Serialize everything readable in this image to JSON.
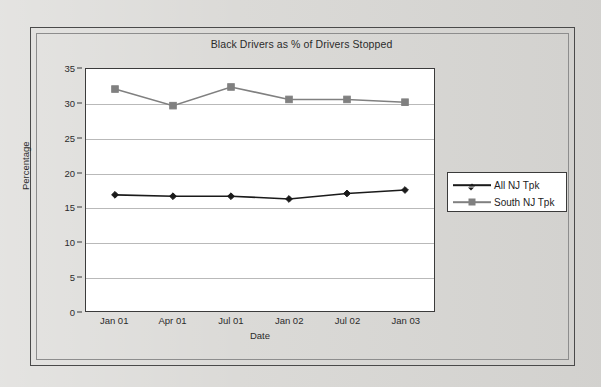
{
  "chart_data": {
    "type": "line",
    "title": "Black Drivers as % of Drivers Stopped",
    "xlabel": "Date",
    "ylabel": "Percentage",
    "categories": [
      "Jan 01",
      "Apr 01",
      "Jul 01",
      "Jan 02",
      "Jul 02",
      "Jan 03"
    ],
    "ylim": [
      0,
      35
    ],
    "yticks": [
      0,
      5,
      10,
      15,
      20,
      25,
      30,
      35
    ],
    "grid": "horizontal",
    "legend_position": "right",
    "series": [
      {
        "name": "All NJ Tpk",
        "marker": "diamond",
        "color": "#1a1a1a",
        "values": [
          16.8,
          16.6,
          16.6,
          16.2,
          17.0,
          17.5
        ]
      },
      {
        "name": "South NJ Tpk",
        "marker": "square",
        "color": "#808080",
        "values": [
          32.1,
          29.7,
          32.4,
          30.6,
          30.6,
          30.2
        ]
      }
    ]
  },
  "frame": {
    "outer_border_color": "#4a4a4a",
    "inner_border_color": "#8d8d8d",
    "page_background": "#d9d8d5"
  }
}
